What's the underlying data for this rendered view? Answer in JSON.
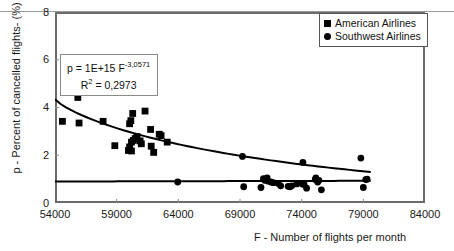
{
  "chart_data": {
    "type": "scatter",
    "title": "",
    "xlabel": "F - Number of flights per month",
    "ylabel": "p - Percent of cancelled flights- (%)",
    "xlim": [
      54000,
      84000
    ],
    "ylim": [
      0,
      8
    ],
    "xticks": [
      "54000",
      "59000",
      "64000",
      "69000",
      "74000",
      "79000",
      "84000"
    ],
    "yticks": [
      "0",
      "2",
      "4",
      "6",
      "8"
    ],
    "grid": false,
    "legend_position": "top-right",
    "series": [
      {
        "name": "American Airlines",
        "marker": "square",
        "color": "#000000",
        "points": [
          [
            54600,
            3.42
          ],
          [
            55800,
            4.72
          ],
          [
            55850,
            4.42
          ],
          [
            56000,
            4.78
          ],
          [
            56150,
            4.75
          ],
          [
            55950,
            3.35
          ],
          [
            57900,
            3.42
          ],
          [
            58850,
            2.4
          ],
          [
            60050,
            3.32
          ],
          [
            60150,
            3.45
          ],
          [
            60300,
            3.75
          ],
          [
            60450,
            4.68
          ],
          [
            59950,
            2.2
          ],
          [
            60050,
            2.35
          ],
          [
            60200,
            2.55
          ],
          [
            60350,
            2.62
          ],
          [
            60500,
            2.7
          ],
          [
            60650,
            2.78
          ],
          [
            60200,
            2.18
          ],
          [
            61300,
            3.85
          ],
          [
            61750,
            3.08
          ],
          [
            61800,
            2.38
          ],
          [
            62000,
            2.12
          ],
          [
            62450,
            2.88
          ],
          [
            62600,
            2.82
          ],
          [
            63100,
            2.55
          ],
          [
            60900,
            2.6
          ],
          [
            61000,
            2.48
          ]
        ]
      },
      {
        "name": "Southwest Airlines",
        "marker": "circle",
        "color": "#000000",
        "points": [
          [
            63950,
            0.88
          ],
          [
            69200,
            1.95
          ],
          [
            69300,
            0.68
          ],
          [
            70700,
            0.65
          ],
          [
            70900,
            1.02
          ],
          [
            71000,
            0.95
          ],
          [
            71200,
            1.05
          ],
          [
            71250,
            0.92
          ],
          [
            71500,
            0.88
          ],
          [
            71700,
            0.85
          ],
          [
            72900,
            0.7
          ],
          [
            73050,
            0.68
          ],
          [
            73200,
            0.72
          ],
          [
            74100,
            1.7
          ],
          [
            74050,
            0.8
          ],
          [
            74200,
            0.78
          ],
          [
            74400,
            0.62
          ],
          [
            75100,
            0.98
          ],
          [
            75150,
            1.05
          ],
          [
            75300,
            0.88
          ],
          [
            75400,
            0.95
          ],
          [
            75600,
            0.55
          ],
          [
            73600,
            0.8
          ],
          [
            72100,
            0.82
          ],
          [
            72300,
            0.72
          ],
          [
            78800,
            1.88
          ],
          [
            79300,
            1.0
          ],
          [
            79200,
            0.98
          ],
          [
            79000,
            0.65
          ]
        ]
      }
    ],
    "trendlines": [
      {
        "for": "American Airlines",
        "type": "power",
        "equation": "p = 1E+15 F^-3.0571",
        "r_squared": "0,2973",
        "x_start": 54000,
        "x_end": 79600,
        "y_start": 4.35,
        "y_end": 1.3
      },
      {
        "for": "Southwest Airlines",
        "type": "linear",
        "x_start": 54000,
        "x_end": 79600,
        "y_start": 0.9,
        "y_end": 0.93
      }
    ]
  },
  "legend": {
    "items": [
      {
        "marker": "square-marker",
        "label": "American Airlines"
      },
      {
        "marker": "circle-marker",
        "label": "Southwest Airlines"
      }
    ]
  },
  "equation_box": {
    "prefix": "p = 1E+15 F",
    "exponent": "-3,0571",
    "r_prefix": "R",
    "r_sup": "2",
    "r_value": "= 0,2973"
  },
  "axes": {
    "x_title": "F - Number of flights per month",
    "y_title": "p - Percent of cancelled flights- (%)",
    "x_ticks": [
      "54000",
      "59000",
      "64000",
      "69000",
      "74000",
      "79000",
      "84000"
    ],
    "y_ticks": [
      "8",
      "6",
      "4",
      "2",
      "0"
    ]
  }
}
